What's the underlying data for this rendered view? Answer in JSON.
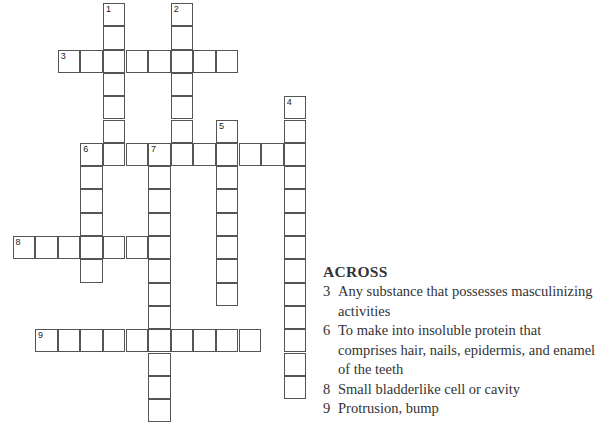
{
  "puzzle": {
    "grid": {
      "origin_x": 12.5,
      "origin_y": 3,
      "cell_w": 22.6,
      "cell_h": 23.3,
      "words": [
        {
          "number": 1,
          "direction": "down",
          "row": 0,
          "col": 4,
          "length": 7
        },
        {
          "number": 2,
          "direction": "down",
          "row": 0,
          "col": 7,
          "length": 7
        },
        {
          "number": 3,
          "direction": "across",
          "row": 2,
          "col": 2,
          "length": 8
        },
        {
          "number": 4,
          "direction": "down",
          "row": 4,
          "col": 12,
          "length": 13
        },
        {
          "number": 5,
          "direction": "down",
          "row": 5,
          "col": 9,
          "length": 8
        },
        {
          "number": 6,
          "direction": "across",
          "row": 6,
          "col": 3,
          "length": 10
        },
        {
          "number": 6,
          "direction": "down",
          "row": 6,
          "col": 3,
          "length": 6
        },
        {
          "number": 7,
          "direction": "down",
          "row": 6,
          "col": 6,
          "length": 12
        },
        {
          "number": 8,
          "direction": "across",
          "row": 10,
          "col": 0,
          "length": 7
        },
        {
          "number": 9,
          "direction": "across",
          "row": 14,
          "col": 1,
          "length": 10
        }
      ]
    },
    "across": {
      "heading": "ACROSS",
      "clues": [
        {
          "number": "3",
          "text": "Any substance that possesses masculinizing activities"
        },
        {
          "number": "6",
          "text": "To make into insoluble protein that comprises hair, nails, epidermis, and enamel of the teeth"
        },
        {
          "number": "8",
          "text": "Small bladderlike cell or cavity"
        },
        {
          "number": "9",
          "text": "Protrusion, bump"
        }
      ]
    }
  }
}
